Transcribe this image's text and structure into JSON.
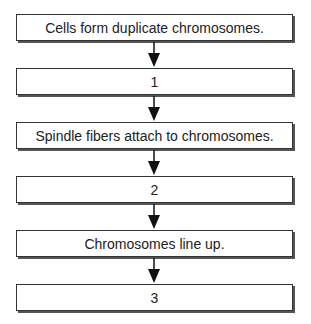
{
  "diagram": {
    "type": "flowchart",
    "direction": "top-to-bottom",
    "steps": [
      {
        "label": "Cells form duplicate chromosomes."
      },
      {
        "label": "1"
      },
      {
        "label": "Spindle fibers attach to chromosomes."
      },
      {
        "label": "2"
      },
      {
        "label": "Chromosomes line up."
      },
      {
        "label": "3"
      }
    ]
  }
}
